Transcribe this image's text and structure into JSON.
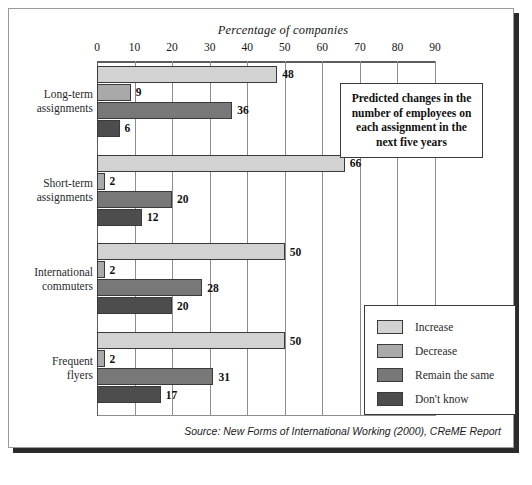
{
  "figure": {
    "axis_title": "Percentage of companies",
    "source_note": "Source: New Forms of International Working (2000), CReME Report",
    "annotation": "Predicted changes in the number of employees on each assignment in the next five years"
  },
  "legend": {
    "items": [
      {
        "label": "Increase",
        "color": "#d2d2d2"
      },
      {
        "label": "Decrease",
        "color": "#a9a9a9"
      },
      {
        "label": "Remain the same",
        "color": "#787878"
      },
      {
        "label": "Don't know",
        "color": "#4d4d4d"
      }
    ]
  },
  "chart_data": {
    "type": "bar",
    "orientation": "horizontal",
    "title": "",
    "xlabel": "Percentage of companies",
    "ylabel": "",
    "xlim": [
      0,
      90
    ],
    "xticks": [
      0,
      10,
      20,
      30,
      40,
      50,
      60,
      70,
      80,
      90
    ],
    "grid": true,
    "legend_position": "inside-bottom-right",
    "categories": [
      "Long-term assignments",
      "Short-term assignments",
      "International commuters",
      "Frequent flyers"
    ],
    "category_lines": [
      [
        "Long-term",
        "assignments"
      ],
      [
        "Short-term",
        "assignments"
      ],
      [
        "International",
        "commuters"
      ],
      [
        "Frequent",
        "flyers"
      ]
    ],
    "series": [
      {
        "name": "Increase",
        "color": "#d2d2d2",
        "values": [
          48,
          66,
          50,
          50
        ]
      },
      {
        "name": "Decrease",
        "color": "#a9a9a9",
        "values": [
          9,
          2,
          2,
          2
        ]
      },
      {
        "name": "Remain the same",
        "color": "#787878",
        "values": [
          36,
          20,
          28,
          31
        ]
      },
      {
        "name": "Don't know",
        "color": "#4d4d4d",
        "values": [
          6,
          12,
          20,
          17
        ]
      }
    ],
    "annotation": "Predicted changes in the number of employees on each assignment in the next five years",
    "source": "Source: New Forms of International Working (2000), CReME Report"
  }
}
